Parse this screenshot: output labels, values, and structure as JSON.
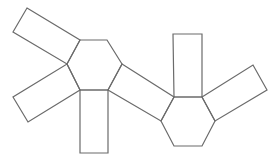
{
  "diagram": {
    "title": "",
    "stroke_color": "#6b6b6b",
    "stroke_width": 1.2,
    "background": "#ffffff",
    "shapes": [
      {
        "name": "hexagon-left",
        "type": "hexagon",
        "points": "80,40 107,40 122,64 108,90 80,90 67,64"
      },
      {
        "name": "hexagon-right",
        "type": "hexagon",
        "points": "174,97 202,97 215,121 202,146 174,146 161,121"
      },
      {
        "name": "rect-top-left",
        "type": "rectangle",
        "points": "27,8 80,40 67,64 13,32"
      },
      {
        "name": "rect-bottom-left",
        "type": "rectangle",
        "points": "67,64 80,90 28,122 13,97"
      },
      {
        "name": "rect-bottom",
        "type": "rectangle",
        "points": "80,90 108,90 108,153 80,153"
      },
      {
        "name": "rect-connector",
        "type": "rectangle",
        "points": "122,64 174,97 161,121 108,90"
      },
      {
        "name": "rect-top-right",
        "type": "rectangle",
        "points": "173,34 202,34 202,97 174,97"
      },
      {
        "name": "rect-right",
        "type": "rectangle",
        "points": "202,97 253,65 267,90 215,121"
      }
    ]
  }
}
